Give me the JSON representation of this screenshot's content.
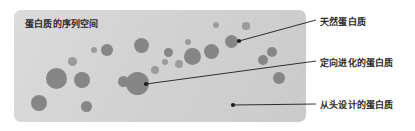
{
  "figure": {
    "width": 415,
    "height": 131,
    "background": "#ffffff"
  },
  "panel": {
    "title": "蛋白质的序列空间",
    "background_color": "#d2d2d2",
    "blob_color": "#8f8f8f",
    "x": 14,
    "y": 10,
    "width": 292,
    "height": 112
  },
  "callouts": [
    {
      "key": "natural",
      "label": "天然蛋白质",
      "anchor_x": 239,
      "anchor_y": 41,
      "line_end_x": 316,
      "line_end_y": 20
    },
    {
      "key": "directed",
      "label": "定向进化的蛋白质",
      "anchor_x": 146,
      "anchor_y": 84,
      "line_end_x": 316,
      "line_end_y": 61
    },
    {
      "key": "denovo",
      "label": "从头设计的蛋白质",
      "anchor_x": 233,
      "anchor_y": 105,
      "line_end_x": 316,
      "line_end_y": 104
    }
  ],
  "line_color": "#1c1c1c",
  "text_color": "#2b2b2b",
  "blobs": [
    {
      "cx": 39,
      "cy": 103,
      "r": 8.0,
      "tone": "dark"
    },
    {
      "cx": 56,
      "cy": 78,
      "r": 10.5,
      "tone": "dark"
    },
    {
      "cx": 72,
      "cy": 61,
      "r": 4.5,
      "tone": "light"
    },
    {
      "cx": 82,
      "cy": 80,
      "r": 8.0,
      "tone": "dark"
    },
    {
      "cx": 86,
      "cy": 106,
      "r": 5.5,
      "tone": "dark"
    },
    {
      "cx": 94,
      "cy": 50,
      "r": 3.2,
      "tone": "light"
    },
    {
      "cx": 107,
      "cy": 50,
      "r": 6.0,
      "tone": "dark"
    },
    {
      "cx": 123,
      "cy": 81,
      "r": 5.5,
      "tone": "dark"
    },
    {
      "cx": 141,
      "cy": 45,
      "r": 7.5,
      "tone": "dark"
    },
    {
      "cx": 137,
      "cy": 83,
      "r": 11.5,
      "tone": "dark"
    },
    {
      "cx": 155,
      "cy": 70,
      "r": 4.0,
      "tone": "light"
    },
    {
      "cx": 165,
      "cy": 62,
      "r": 3.2,
      "tone": "light"
    },
    {
      "cx": 168,
      "cy": 52,
      "r": 4.5,
      "tone": "dark"
    },
    {
      "cx": 179,
      "cy": 64,
      "r": 4.0,
      "tone": "light"
    },
    {
      "cx": 188,
      "cy": 42,
      "r": 3.4,
      "tone": "light"
    },
    {
      "cx": 192,
      "cy": 56,
      "r": 8.5,
      "tone": "dark"
    },
    {
      "cx": 211,
      "cy": 51,
      "r": 7.5,
      "tone": "dark"
    },
    {
      "cx": 216,
      "cy": 25,
      "r": 3.0,
      "tone": "light"
    },
    {
      "cx": 231,
      "cy": 41,
      "r": 6.5,
      "tone": "dark"
    },
    {
      "cx": 246,
      "cy": 26,
      "r": 3.6,
      "tone": "light"
    },
    {
      "cx": 263,
      "cy": 60,
      "r": 5.0,
      "tone": "dark"
    },
    {
      "cx": 272,
      "cy": 52,
      "r": 5.0,
      "tone": "dark"
    },
    {
      "cx": 279,
      "cy": 78,
      "r": 6.0,
      "tone": "dark"
    }
  ]
}
